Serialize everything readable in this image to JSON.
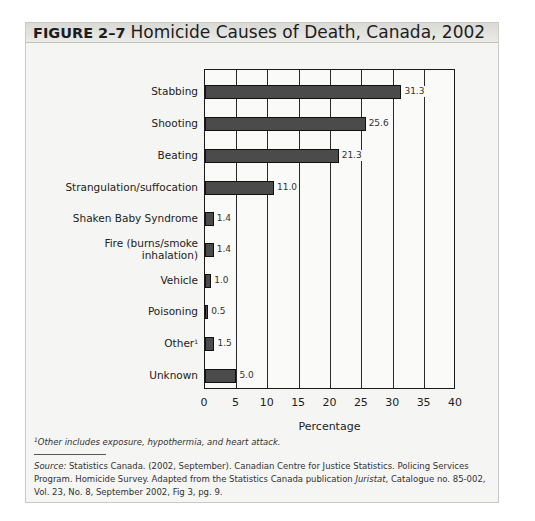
{
  "figure": {
    "number": "FIGURE 2–7",
    "title": "Homicide Causes of Death, Canada, 2002",
    "footnote": "Other includes exposure, hypothermia, and heart attack.",
    "footnote_marker": "1",
    "source_label": "Source:",
    "source_text_1": " Statistics Canada. (2002, September). Canadian Centre for Justice Statistics. Policing Services Program. Homicide Survey. Adapted from the Statistics Canada publication ",
    "source_publication": "Juristat",
    "source_text_2": ", Catalogue no. 85-002, Vol. 23, No. 8, September 2002, Fig 3, pg. 9."
  },
  "chart_data": {
    "type": "bar",
    "orientation": "horizontal",
    "title": "Homicide Causes of Death, Canada, 2002",
    "xlabel": "Percentage",
    "ylabel": "",
    "xlim": [
      0,
      40
    ],
    "xticks": [
      "0",
      "5",
      "10",
      "15",
      "20",
      "25",
      "30",
      "35",
      "40"
    ],
    "grid": true,
    "legend": "none",
    "categories": [
      "Stabbing",
      "Shooting",
      "Beating",
      "Strangulation/suffocation",
      "Shaken Baby Syndrome",
      "Fire (burns/smoke inhalation)",
      "Vehicle",
      "Poisoning",
      "Other",
      "Unknown"
    ],
    "category_lines": [
      [
        "Stabbing"
      ],
      [
        "Shooting"
      ],
      [
        "Beating"
      ],
      [
        "Strangulation/suffocation"
      ],
      [
        "Shaken Baby Syndrome"
      ],
      [
        "Fire (burns/smoke",
        "inhalation)"
      ],
      [
        "Vehicle"
      ],
      [
        "Poisoning"
      ],
      [
        "Other"
      ],
      [
        "Unknown"
      ]
    ],
    "category_markers": [
      "",
      "",
      "",
      "",
      "",
      "",
      "",
      "",
      "1",
      ""
    ],
    "values": [
      31.3,
      25.6,
      21.3,
      11.0,
      1.4,
      1.4,
      1.0,
      0.5,
      1.5,
      5.0
    ],
    "value_labels": [
      "31.3",
      "25.6",
      "21.3",
      "11.0",
      "1.4",
      "1.4",
      "1.0",
      "0.5",
      "1.5",
      "5.0"
    ],
    "bar_color": "#4b4b4b"
  }
}
